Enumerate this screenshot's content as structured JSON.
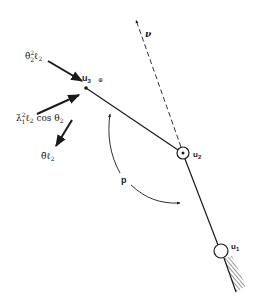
{
  "diagram": {
    "type": "mechanism-link-diagram",
    "colors": {
      "ink": "#1a1a1a",
      "background": "#ffffff"
    },
    "nodes": {
      "u1": {
        "label": "u",
        "sub": "1"
      },
      "u2": {
        "label": "u",
        "sub": "2"
      },
      "u3": {
        "label": "u",
        "sub": "3"
      }
    },
    "direction_label": "ν",
    "angle_label": "p",
    "small_symbol": "⊕",
    "force_labels": {
      "theta_dot_sq": {
        "base": "θ̇",
        "sup": "2",
        "sub": "2",
        "rest": "ℓ",
        "rest_sub": "2"
      },
      "lambda_dot_sq": {
        "base": "λ̇",
        "sup": "2",
        "sub": "1",
        "rest": "ℓ",
        "rest_sub": "2",
        "tail": " cos θ",
        "tail_sub": "2"
      },
      "theta_ddot": {
        "base": "θ̈",
        "rest": "ℓ",
        "rest_sub": "2"
      }
    }
  }
}
